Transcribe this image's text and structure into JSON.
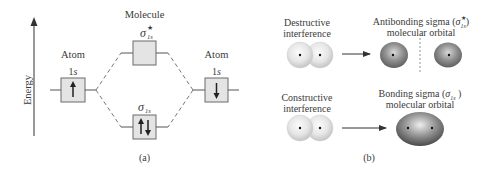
{
  "panel_a": {
    "caption": "(a)",
    "axis_label": "Energy",
    "molecule_label": "Molecule",
    "left_atom": {
      "label": "Atom",
      "orbital": "1",
      "orbital_italic": "s",
      "electron": "up"
    },
    "right_atom": {
      "label": "Atom",
      "orbital": "1",
      "orbital_italic": "s",
      "electron": "down"
    },
    "antibonding": {
      "symbol": "σ",
      "subscript": "1s",
      "superscript": "★",
      "electrons": "none"
    },
    "bonding": {
      "symbol": "σ",
      "subscript": "1s",
      "electrons": "up-down pair"
    }
  },
  "panel_b": {
    "caption": "(b)",
    "destructive": {
      "label_line1": "Destructive",
      "label_line2": "interference",
      "result_line1_prefix": "Antibonding sigma (",
      "result_symbol": "σ",
      "result_superscript": "★",
      "result_subscript": "1s",
      "result_line1_suffix": ")",
      "result_line2": "molecular orbital"
    },
    "constructive": {
      "label_line1": "Constructive",
      "label_line2": "interference",
      "result_line1_prefix": "Bonding sigma (",
      "result_symbol": "σ",
      "result_subscript": "1s",
      "result_line1_suffix": " )",
      "result_line2": "molecular orbital"
    }
  },
  "colors": {
    "line": "#555555",
    "box_fill": "#e4e4e4",
    "box_stroke": "#6a6a6a",
    "text": "#3a3a3a",
    "sphere_light": "#f4f4f4",
    "orbital_dark": "#5a5a5a"
  }
}
